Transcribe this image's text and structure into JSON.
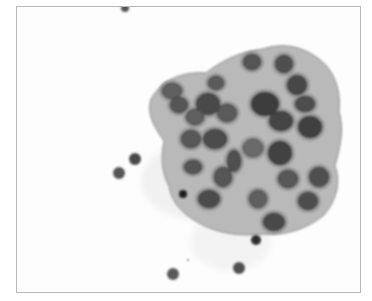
{
  "image": {
    "kind": "cytology micrograph (grayscale)",
    "frame": {
      "x": 16,
      "y": 6,
      "w": 345,
      "h": 287,
      "border": "#b8b8b8",
      "background": "#fdfdfd"
    },
    "cluster": {
      "outline": "M150,98 C160,80 180,70 205,72 C220,60 240,50 262,48 C280,42 300,44 318,58 C334,70 340,90 338,110 C344,130 338,150 334,165 C340,180 336,200 322,215 C305,228 285,235 262,233 C240,236 215,232 198,222 C180,212 170,200 168,185 C160,170 160,155 163,140 C155,128 145,115 150,98 Z",
      "fill": "#b9b9b9",
      "nuclei": [
        {
          "cx": 251,
          "cy": 61,
          "rx": 9,
          "ry": 8,
          "shade": "#555"
        },
        {
          "cx": 283,
          "cy": 63,
          "rx": 9,
          "ry": 9,
          "shade": "#505050"
        },
        {
          "cx": 296,
          "cy": 84,
          "rx": 10,
          "ry": 10,
          "shade": "#474747"
        },
        {
          "cx": 215,
          "cy": 82,
          "rx": 8,
          "ry": 7,
          "shade": "#5c5c5c"
        },
        {
          "cx": 171,
          "cy": 90,
          "rx": 10,
          "ry": 8,
          "shade": "#606060"
        },
        {
          "cx": 178,
          "cy": 104,
          "rx": 9,
          "ry": 8,
          "shade": "#565656"
        },
        {
          "cx": 207,
          "cy": 103,
          "rx": 12,
          "ry": 11,
          "shade": "#4a4a4a"
        },
        {
          "cx": 226,
          "cy": 112,
          "rx": 10,
          "ry": 9,
          "shade": "#5a5a5a"
        },
        {
          "cx": 264,
          "cy": 103,
          "rx": 14,
          "ry": 12,
          "shade": "#3e3e3e"
        },
        {
          "cx": 280,
          "cy": 120,
          "rx": 12,
          "ry": 10,
          "shade": "#444"
        },
        {
          "cx": 309,
          "cy": 126,
          "rx": 12,
          "ry": 11,
          "shade": "#3f3f3f"
        },
        {
          "cx": 304,
          "cy": 103,
          "rx": 10,
          "ry": 8,
          "shade": "#4d4d4d"
        },
        {
          "cx": 194,
          "cy": 116,
          "rx": 9,
          "ry": 8,
          "shade": "#5f5f5f"
        },
        {
          "cx": 190,
          "cy": 138,
          "rx": 10,
          "ry": 9,
          "shade": "#585858"
        },
        {
          "cx": 214,
          "cy": 138,
          "rx": 12,
          "ry": 10,
          "shade": "#4b4b4b"
        },
        {
          "cx": 252,
          "cy": 147,
          "rx": 10,
          "ry": 9,
          "shade": "#6a6a6a"
        },
        {
          "cx": 279,
          "cy": 152,
          "rx": 12,
          "ry": 12,
          "shade": "#434343"
        },
        {
          "cx": 192,
          "cy": 166,
          "rx": 9,
          "ry": 7,
          "shade": "#555"
        },
        {
          "cx": 233,
          "cy": 160,
          "rx": 7,
          "ry": 11,
          "shade": "#4f4f4f"
        },
        {
          "cx": 222,
          "cy": 176,
          "rx": 9,
          "ry": 10,
          "shade": "#575757"
        },
        {
          "cx": 208,
          "cy": 198,
          "rx": 11,
          "ry": 9,
          "shade": "#4c4c4c"
        },
        {
          "cx": 257,
          "cy": 198,
          "rx": 9,
          "ry": 9,
          "shade": "#5e5e5e"
        },
        {
          "cx": 287,
          "cy": 178,
          "rx": 10,
          "ry": 9,
          "shade": "#595959"
        },
        {
          "cx": 318,
          "cy": 176,
          "rx": 10,
          "ry": 10,
          "shade": "#505050"
        },
        {
          "cx": 307,
          "cy": 200,
          "rx": 10,
          "ry": 9,
          "shade": "#4e4e4e"
        },
        {
          "cx": 273,
          "cy": 221,
          "rx": 11,
          "ry": 9,
          "shade": "#4a4a4a"
        }
      ]
    },
    "stray_cells": [
      {
        "cx": 124,
        "cy": 7,
        "r": 4,
        "shade": "#555"
      },
      {
        "cx": 134,
        "cy": 158,
        "r": 6,
        "shade": "#4a4a4a"
      },
      {
        "cx": 118,
        "cy": 172,
        "r": 6,
        "shade": "#565656"
      },
      {
        "cx": 182,
        "cy": 193,
        "r": 4,
        "shade": "#1e1e1e"
      },
      {
        "cx": 255,
        "cy": 239,
        "r": 5,
        "shade": "#2e2e2e"
      },
      {
        "cx": 238,
        "cy": 267,
        "r": 6,
        "shade": "#505050"
      },
      {
        "cx": 172,
        "cy": 273,
        "r": 6,
        "shade": "#5a5a5a"
      },
      {
        "cx": 187,
        "cy": 259,
        "r": 1,
        "shade": "#666"
      }
    ]
  }
}
